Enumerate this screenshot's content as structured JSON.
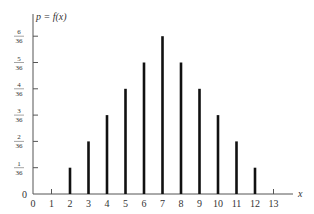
{
  "chart_data": {
    "type": "bar",
    "title": "",
    "ylabel": "p = f(x)",
    "xlabel": "x",
    "categories": [
      2,
      3,
      4,
      5,
      6,
      7,
      8,
      9,
      10,
      11,
      12
    ],
    "values": [
      0.02778,
      0.05556,
      0.08333,
      0.11111,
      0.13889,
      0.16667,
      0.13889,
      0.11111,
      0.08333,
      0.05556,
      0.02778
    ],
    "values_fraction": [
      "1/36",
      "2/36",
      "3/36",
      "4/36",
      "5/36",
      "6/36",
      "5/36",
      "4/36",
      "3/36",
      "2/36",
      "1/36"
    ],
    "x_ticks": [
      "0",
      "1",
      "2",
      "3",
      "4",
      "5",
      "6",
      "7",
      "8",
      "9",
      "10",
      "11",
      "12",
      "13"
    ],
    "y_ticks": [
      {
        "num": "1",
        "den": "36"
      },
      {
        "num": "2",
        "den": "36"
      },
      {
        "num": "3",
        "den": "36"
      },
      {
        "num": "4",
        "den": "36"
      },
      {
        "num": "5",
        "den": "36"
      },
      {
        "num": "6",
        "den": "36"
      }
    ],
    "y_zero_label": "0",
    "xlim": [
      0,
      13
    ],
    "ylim": [
      0,
      0.16667
    ],
    "grid": false,
    "legend": null,
    "bar_color": "#111111"
  }
}
